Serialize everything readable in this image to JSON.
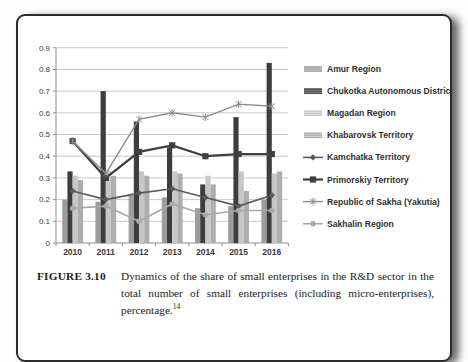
{
  "page": {
    "figure_label": "FIGURE 3.10",
    "caption": "Dynamics of the share of small enterprises in the R&D sector in the total number of small enterprises (including micro-enterprises), percentage.",
    "footnote_ref": "14"
  },
  "chart_data": {
    "type": "bar",
    "subtype": "combo-bar-line",
    "title": "",
    "xlabel": "",
    "ylabel": "",
    "categories": [
      "2010",
      "2011",
      "2012",
      "2013",
      "2014",
      "2015",
      "2016"
    ],
    "y_axis": {
      "min": 0,
      "max": 0.9,
      "step": 0.1,
      "tick_labels": [
        "0",
        "0.1",
        "0.2",
        "0.3",
        "0.4",
        "0.5",
        "0.6",
        "0.7",
        "0.8",
        "0.9"
      ]
    },
    "grid": true,
    "legend_position": "right",
    "bar_series": [
      {
        "name": "Amur Region",
        "color": "#9d9d9d",
        "values": [
          0.2,
          0.19,
          0.22,
          0.21,
          0.16,
          0.17,
          0.2
        ]
      },
      {
        "name": "Chukotka Autonomous District",
        "color": "#3d3d3d",
        "values": [
          0.33,
          0.7,
          0.56,
          0.44,
          0.27,
          0.58,
          0.83
        ]
      },
      {
        "name": "Magadan Region",
        "color": "#c7c7c7",
        "values": [
          0.31,
          0.33,
          0.33,
          0.33,
          0.31,
          0.33,
          0.32
        ]
      },
      {
        "name": "Khabarovsk Territory",
        "color": "#aeaeae",
        "values": [
          0.29,
          0.31,
          0.31,
          0.32,
          0.27,
          0.24,
          0.33
        ]
      }
    ],
    "line_series": [
      {
        "name": "Kamchatka Territory",
        "color": "#5a5a5a",
        "marker": "diamond",
        "values": [
          0.24,
          0.2,
          0.23,
          0.25,
          0.21,
          0.17,
          0.22
        ]
      },
      {
        "name": "Primorskiy Territory",
        "color": "#3f3f3f",
        "marker": "square",
        "values": [
          0.47,
          0.3,
          0.42,
          0.45,
          0.4,
          0.41,
          0.41
        ]
      },
      {
        "name": "Republic of Sakha (Yakutia)",
        "color": "#8c8c8c",
        "marker": "asterisk",
        "values": [
          0.47,
          0.32,
          0.57,
          0.6,
          0.58,
          0.64,
          0.63
        ]
      },
      {
        "name": "Sakhalin Region",
        "color": "#a8a8a8",
        "marker": "circle",
        "values": [
          0.16,
          0.17,
          0.1,
          0.18,
          0.13,
          0.15,
          0.15
        ]
      }
    ],
    "colors": {
      "gridline": "#c9c9c9",
      "axis": "#8f8f8f",
      "tick_text": "#3a3a3a",
      "legend_text": "#2f2f2f"
    }
  }
}
